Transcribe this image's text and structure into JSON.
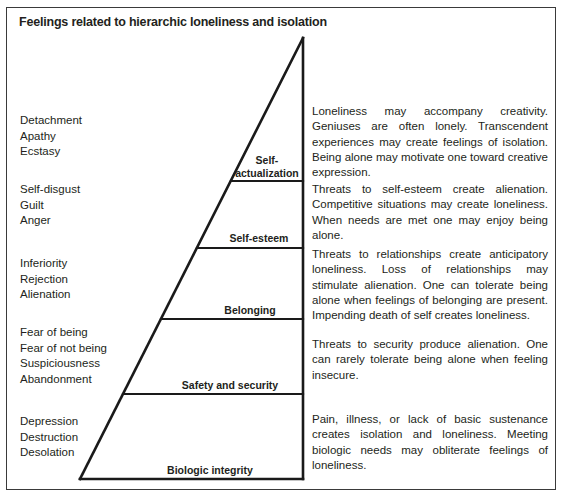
{
  "title": "Feelings related to hierarchic loneliness and isolation",
  "levels": [
    {
      "name": "Self-actualization",
      "label_line1": "Self-",
      "label_line2": "actualization",
      "feelings": [
        "Detachment",
        "Apathy",
        "Ecstasy"
      ],
      "description": "Loneliness may accompany creativity. Geniuses are often lonely. Transcendent experiences may create feelings of isolation. Being alone may motivate one toward creative expression."
    },
    {
      "name": "Self-esteem",
      "label_line1": "Self-esteem",
      "feelings": [
        "Self-disgust",
        "Guilt",
        "Anger"
      ],
      "description": "Threats to self-esteem create alienation. Competitive situations may create loneliness. When needs are met one may enjoy being alone."
    },
    {
      "name": "Belonging",
      "label_line1": "Belonging",
      "feelings": [
        "Inferiority",
        "Rejection",
        "Alienation"
      ],
      "description": "Threats to relationships create anticipatory loneliness. Loss of relationships may stimulate alienation. One can tolerate being alone when feelings of belonging are present. Impending death of self creates loneliness."
    },
    {
      "name": "Safety and security",
      "label_line1": "Safety and security",
      "feelings": [
        "Fear of being",
        "Fear of not being",
        "Suspiciousness",
        "Abandonment"
      ],
      "description": "Threats to security produce alienation. One can rarely tolerate being alone when feeling insecure."
    },
    {
      "name": "Biologic integrity",
      "label_line1": "Biologic integrity",
      "feelings": [
        "Depression",
        "Destruction",
        "Desolation"
      ],
      "description": "Pain, illness, or lack of basic sustenance creates isolation and loneliness. Meeting biologic needs may obliterate feelings of loneliness."
    }
  ],
  "colors": {
    "line": "#1a1a1a",
    "text": "#231f20",
    "frame": "#3a3a3a"
  }
}
